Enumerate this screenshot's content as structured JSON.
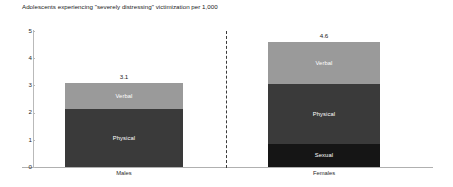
{
  "chart_data": {
    "type": "bar",
    "subtype": "stacked-bar",
    "title": "Adolescents experiencing \"severely distressing\" victimization per 1,000",
    "xlabel": "",
    "ylabel": "",
    "ylim": [
      0,
      5
    ],
    "yticks": [
      "0",
      "1",
      "2",
      "3",
      "4",
      "5"
    ],
    "grid": false,
    "legend": "none-inline-segment-labels",
    "categories": [
      "Males",
      "Females"
    ],
    "totals": [
      "3.1",
      "4.6"
    ],
    "series": [
      {
        "name": "Sexual",
        "values": [
          0,
          0.85
        ],
        "color": "#151515"
      },
      {
        "name": "Physical",
        "values": [
          2.15,
          2.2
        ],
        "color": "#3a3a3a"
      },
      {
        "name": "Verbal",
        "values": [
          0.95,
          1.55
        ],
        "color": "#9a9a9a"
      }
    ],
    "bars": [
      {
        "category": "Males",
        "total": "3.1",
        "segments": [
          {
            "label": "Verbal",
            "value": 0.95,
            "color": "#9a9a9a",
            "show_label": true
          },
          {
            "label": "Physical",
            "value": 2.15,
            "color": "#3a3a3a",
            "show_label": true
          }
        ]
      },
      {
        "category": "Females",
        "total": "4.6",
        "segments": [
          {
            "label": "Verbal",
            "value": 1.55,
            "color": "#9a9a9a",
            "show_label": true
          },
          {
            "label": "Physical",
            "value": 2.2,
            "color": "#3a3a3a",
            "show_label": true
          },
          {
            "label": "Sexual",
            "value": 0.85,
            "color": "#151515",
            "show_label": true
          }
        ]
      }
    ],
    "divider": {
      "style": "dashed",
      "orientation": "vertical",
      "color": "#3b3b3b"
    },
    "colors": {
      "verbal": "#9a9a9a",
      "physical": "#3a3a3a",
      "sexual": "#151515",
      "axis": "#b0b0b0",
      "text": "#1b1b1b",
      "background": "#ffffff"
    }
  }
}
